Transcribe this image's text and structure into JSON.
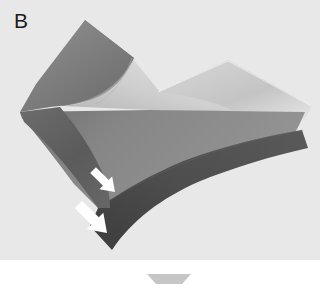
{
  "figure": {
    "panel_label": "B",
    "domain_type": "3d-surface-rendering",
    "background_color": "#e8e8e8",
    "page_background_color": "#ffffff",
    "width": 320,
    "height": 293
  },
  "surface": {
    "name": "folded-surface",
    "faces": [
      {
        "id": "upper-left-wedge",
        "name": "upper-left-dark-wedge",
        "tone_label": "medium-dark-gray",
        "color": "#7a7a7a",
        "points": "85,20 132,58 116,96 60,104 26,112 36,86"
      },
      {
        "id": "upper-left-inner-curve",
        "name": "upper-left-inner-curved-face",
        "tone_label": "medium-gray",
        "color": "#8d8d8d",
        "points": "85,20 132,58 112,92 80,100 55,104 38,88"
      },
      {
        "id": "valley-light-face",
        "name": "central-valley-light-face",
        "tone_label": "light-gray",
        "color": "#c9c9c9",
        "points": "70,104 132,58 160,92 205,96 150,104"
      },
      {
        "id": "right-bright-ridge",
        "name": "right-bright-ridge-face",
        "tone_label": "near-white-highlight",
        "color": "#f0f0f0",
        "points": "228,62 310,108 300,116 205,96 160,92"
      },
      {
        "id": "right-upper-shelf",
        "name": "right-upper-shelf-face",
        "tone_label": "light-gray",
        "color": "#cdcdcd",
        "points": "160,92 228,62 310,108 300,118 150,110"
      },
      {
        "id": "front-mid-band",
        "name": "front-mid-gray-band",
        "tone_label": "medium-gray",
        "color": "#8a8a8a",
        "points": "20,112 150,108 305,112 302,132 180,150 96,206 76,186 30,138"
      },
      {
        "id": "front-dark-band",
        "name": "front-dark-band",
        "tone_label": "dark-gray",
        "color": "#4c4c4c",
        "points": "98,206 186,152 302,132 308,150 200,186 112,250 92,228"
      },
      {
        "id": "left-arm-dark",
        "name": "left-arm-dark-face",
        "tone_label": "dark-gray",
        "color": "#5c5c5c",
        "points": "20,112 62,106 92,140 108,186 96,206 62,160 26,126"
      }
    ]
  },
  "annotations": {
    "arrows": [
      {
        "id": "arrow-upper",
        "name": "annotation-arrow-upper",
        "color": "#ffffff",
        "direction": "down-left",
        "tip_x": 115,
        "tip_y": 192,
        "scale": 1.0,
        "rotation_deg": 225
      },
      {
        "id": "arrow-lower",
        "name": "annotation-arrow-lower",
        "color": "#ffffff",
        "direction": "down-left",
        "tip_x": 107,
        "tip_y": 232,
        "scale": 1.28,
        "rotation_deg": 225
      }
    ]
  },
  "footer_marker": {
    "name": "scale-marker-trapezoid",
    "shape": "trapezoid",
    "color": "#c6c6c6",
    "top_left_x": 147,
    "top_right_x": 191,
    "bottom_left_x": 156,
    "bottom_right_x": 182,
    "top_y": 274,
    "bottom_y": 284
  }
}
